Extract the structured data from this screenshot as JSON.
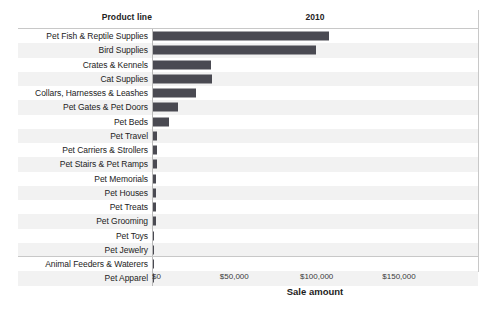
{
  "header": {
    "dimension_label": "Product line",
    "measure_label": "2010"
  },
  "axis": {
    "title": "Sale amount",
    "ticks": [
      {
        "label": "$0",
        "value": 0
      },
      {
        "label": "$50,000",
        "value": 50000
      },
      {
        "label": "$100,000",
        "value": 100000
      },
      {
        "label": "$150,000",
        "value": 150000
      }
    ]
  },
  "colors": {
    "bar": "#4a4a52",
    "band": "#f2f2f2",
    "gridline": "#c8c8c8",
    "text": "#222222"
  },
  "chart_data": {
    "type": "bar",
    "orientation": "horizontal",
    "title": "2010",
    "xlabel": "Sale amount",
    "ylabel": "Product line",
    "xlim": [
      0,
      198000
    ],
    "grid": false,
    "legend": "none",
    "categories": [
      "Pet Fish & Reptile Supplies",
      "Bird Supplies",
      "Crates & Kennels",
      "Cat Supplies",
      "Collars, Harnesses & Leashes",
      "Pet Gates & Pet Doors",
      "Pet Beds",
      "Pet Travel",
      "Pet Carriers & Strollers",
      "Pet Stairs & Pet Ramps",
      "Pet Memorials",
      "Pet Houses",
      "Pet Treats",
      "Pet Grooming",
      "Pet Toys",
      "Pet Jewelry",
      "Animal Feeders & Waterers",
      "Pet Apparel"
    ],
    "values": [
      107000,
      99000,
      35500,
      36000,
      26000,
      15000,
      9500,
      2400,
      2300,
      2200,
      2100,
      2000,
      1900,
      2000,
      400,
      350,
      300,
      250
    ],
    "series": [
      {
        "name": "2010",
        "values": [
          107000,
          99000,
          35500,
          36000,
          26000,
          15000,
          9500,
          2400,
          2300,
          2200,
          2100,
          2000,
          1900,
          2000,
          400,
          350,
          300,
          250
        ]
      }
    ]
  }
}
